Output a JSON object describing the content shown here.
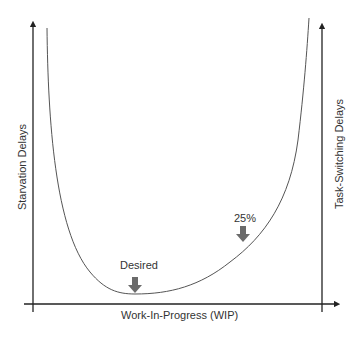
{
  "diagram": {
    "title": "",
    "x_axis_label": "Work-In-Progress (WIP)",
    "left_axis_label": "Starvation Delays",
    "right_axis_label": "Task-Switching Delays",
    "annotations": [
      {
        "label": "Desired",
        "marker": "down-arrow",
        "position": "curve minimum"
      },
      {
        "label": "25%",
        "marker": "down-arrow",
        "position": "rising right side of curve"
      }
    ],
    "curve": "U-shaped total delay curve: high starvation delays at low WIP, minimum at desired WIP, rising task-switching delays at high WIP",
    "colors": {
      "axis": "#222222",
      "curve": "#555555",
      "arrow": "#6b6b6b",
      "text": "#333333"
    }
  }
}
